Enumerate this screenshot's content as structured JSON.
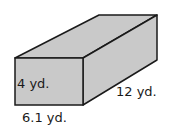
{
  "figure": {
    "shape": "rectangular prism",
    "labels": {
      "height": "4 yd.",
      "width": "6.1 yd.",
      "length": "12 yd."
    },
    "colors": {
      "face": "#c9c9c9",
      "edge": "#1a1a1a",
      "background": "#ffffff"
    }
  }
}
